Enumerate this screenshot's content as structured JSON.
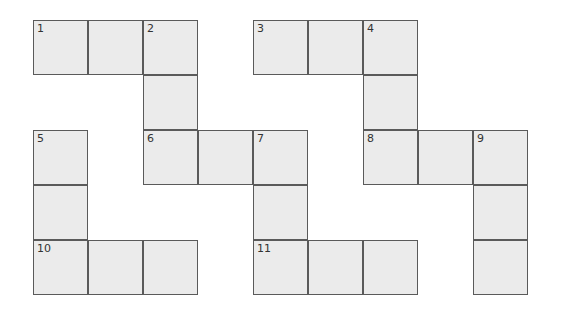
{
  "puzzle": {
    "type": "crossword-grid",
    "cell_size": 55,
    "origin": {
      "x": 33,
      "y": 20
    },
    "colors": {
      "cell_fill": "#ebebeb",
      "cell_border": "#5a5a5a",
      "number": "#333333"
    },
    "cells": [
      {
        "row": 0,
        "col": 0,
        "number": "1"
      },
      {
        "row": 0,
        "col": 1,
        "number": ""
      },
      {
        "row": 0,
        "col": 2,
        "number": "2"
      },
      {
        "row": 0,
        "col": 4,
        "number": "3"
      },
      {
        "row": 0,
        "col": 5,
        "number": ""
      },
      {
        "row": 0,
        "col": 6,
        "number": "4"
      },
      {
        "row": 1,
        "col": 2,
        "number": ""
      },
      {
        "row": 1,
        "col": 6,
        "number": ""
      },
      {
        "row": 2,
        "col": 0,
        "number": "5"
      },
      {
        "row": 2,
        "col": 2,
        "number": "6"
      },
      {
        "row": 2,
        "col": 3,
        "number": ""
      },
      {
        "row": 2,
        "col": 4,
        "number": "7"
      },
      {
        "row": 2,
        "col": 6,
        "number": "8"
      },
      {
        "row": 2,
        "col": 7,
        "number": ""
      },
      {
        "row": 2,
        "col": 8,
        "number": "9"
      },
      {
        "row": 3,
        "col": 0,
        "number": ""
      },
      {
        "row": 3,
        "col": 4,
        "number": ""
      },
      {
        "row": 3,
        "col": 8,
        "number": ""
      },
      {
        "row": 4,
        "col": 0,
        "number": "10"
      },
      {
        "row": 4,
        "col": 1,
        "number": ""
      },
      {
        "row": 4,
        "col": 2,
        "number": ""
      },
      {
        "row": 4,
        "col": 4,
        "number": "11"
      },
      {
        "row": 4,
        "col": 5,
        "number": ""
      },
      {
        "row": 4,
        "col": 6,
        "number": ""
      },
      {
        "row": 4,
        "col": 8,
        "number": ""
      }
    ]
  }
}
